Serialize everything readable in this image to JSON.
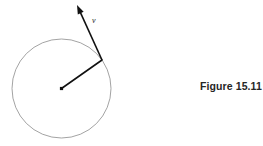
{
  "figure": {
    "caption": "Figure 15.11",
    "vector_label": "v",
    "background_color": "#ffffff",
    "circle": {
      "name": "circular-path",
      "center_x": 61.5,
      "center_y": 88.5,
      "radius": 49.5,
      "stroke_color": "#8c8c8c",
      "stroke_width": 0.8,
      "fill": "none"
    },
    "center_dot": {
      "name": "circle-center-point",
      "x": 61.5,
      "y": 88.5,
      "size": 3.2,
      "color": "#111111"
    },
    "radius_line": {
      "name": "radius-line",
      "x1": 61.5,
      "y1": 88.5,
      "x2": 102,
      "y2": 60,
      "stroke_color": "#111111",
      "stroke_width": 1.6
    },
    "velocity_vector": {
      "name": "velocity-vector",
      "x1": 102,
      "y1": 60,
      "x2": 77,
      "y2": 5,
      "stroke_color": "#111111",
      "stroke_width": 1.6,
      "arrowhead_length": 9,
      "arrowhead_half_width": 3.2
    },
    "label_position": {
      "x": 92,
      "y": 23
    }
  }
}
